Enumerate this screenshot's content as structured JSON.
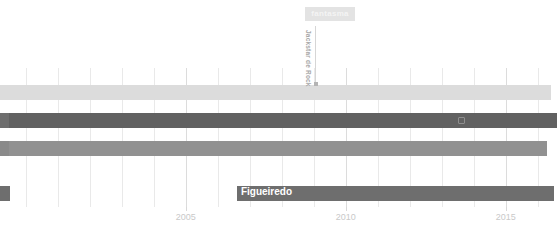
{
  "chart_data": {
    "type": "bar",
    "orientation": "horizontal",
    "title": "",
    "xlabel": "",
    "ylabel": "",
    "xlim": [
      1999.2,
      2016.6
    ],
    "grid": true,
    "legend": false,
    "axis": {
      "tick_labels": [
        "2005",
        "2010",
        "2015"
      ],
      "tick_values": [
        2005,
        2010,
        2015
      ],
      "gridline_values": [
        2000,
        2001,
        2002,
        2003,
        2004,
        2005,
        2006,
        2007,
        2008,
        2009,
        2010,
        2011,
        2012,
        2013,
        2014,
        2015,
        2016
      ]
    },
    "series": [
      {
        "name": "track-1",
        "color": "#dcdcdc",
        "row": 0,
        "segments": [
          {
            "start": 1999.2,
            "end": 2016.4
          }
        ]
      },
      {
        "name": "track-2",
        "color": "#616161",
        "row": 1,
        "segments": [
          {
            "start": 1999.2,
            "end": 2016.6
          }
        ]
      },
      {
        "name": "track-3",
        "color": "#919191",
        "row": 2,
        "segments": [
          {
            "start": 1999.2,
            "end": 2016.3
          }
        ]
      },
      {
        "name": "track-4",
        "color": "#6e6e6e",
        "row": 3,
        "segments": [
          {
            "start": 1999.2,
            "end": 1999.5
          },
          {
            "start": 2006.6,
            "end": 2016.5
          }
        ]
      }
    ],
    "annotations": [
      {
        "name": "pill",
        "text": "fantasma",
        "style": "pill",
        "background": "#e3e3e3",
        "color": "#f4f4f4"
      },
      {
        "name": "leader",
        "text": "Jackstar de Rock",
        "style": "rotated-leader",
        "color": "#a8a8a8",
        "target_row": 0
      },
      {
        "name": "callout",
        "text": "Figueiredo",
        "style": "on-bar",
        "color": "#ffffff",
        "target_row": 3
      }
    ],
    "marker": {
      "name": "bar-marker",
      "row": 1,
      "value": 2013.6,
      "color": "#8e8e8e"
    }
  }
}
